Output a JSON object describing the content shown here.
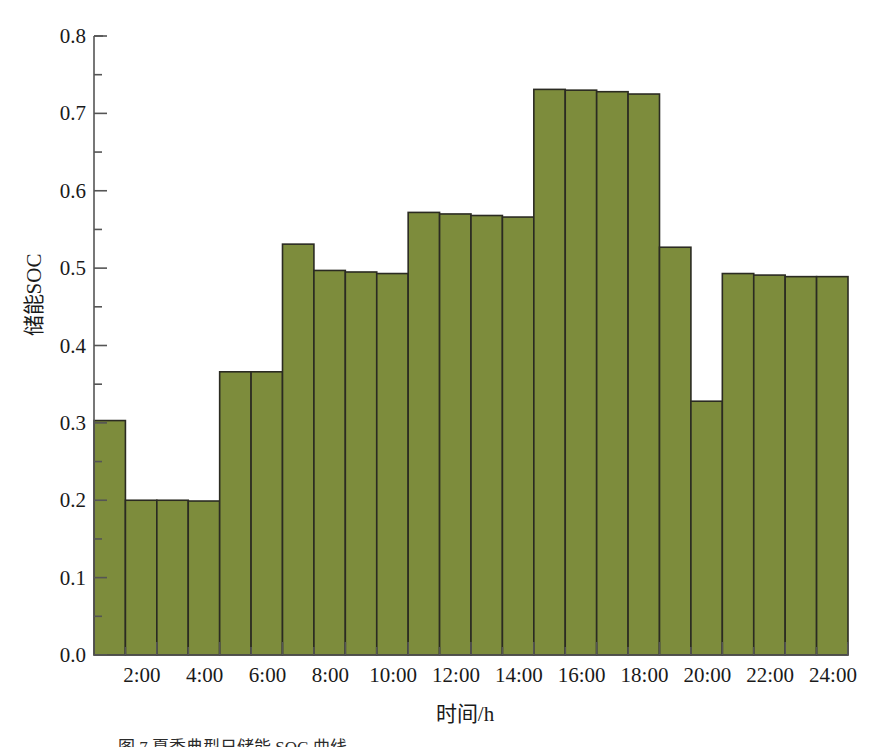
{
  "chart_data": {
    "type": "bar",
    "title": "",
    "xlabel": "时间/h",
    "ylabel": "储能SOC",
    "xlim": [
      0,
      24
    ],
    "ylim": [
      0.0,
      0.8
    ],
    "grid": false,
    "legend": null,
    "bar_color": "#7d8c3c",
    "bar_edge_color": "#2b2b22",
    "axis_color": "#555555",
    "categories": [
      "1:00",
      "2:00",
      "3:00",
      "4:00",
      "5:00",
      "6:00",
      "7:00",
      "8:00",
      "9:00",
      "10:00",
      "11:00",
      "12:00",
      "13:00",
      "14:00",
      "15:00",
      "16:00",
      "17:00",
      "18:00",
      "19:00",
      "20:00",
      "21:00",
      "22:00",
      "23:00",
      "24:00"
    ],
    "values": [
      0.303,
      0.2,
      0.2,
      0.199,
      0.366,
      0.366,
      0.531,
      0.497,
      0.495,
      0.493,
      0.572,
      0.57,
      0.568,
      0.566,
      0.731,
      0.73,
      0.728,
      0.725,
      0.527,
      0.328,
      0.493,
      0.491,
      0.489,
      0.489
    ],
    "y_ticks": [
      "0.0",
      "0.1",
      "0.2",
      "0.3",
      "0.4",
      "0.5",
      "0.6",
      "0.7",
      "0.8"
    ],
    "y_tick_values": [
      0.0,
      0.1,
      0.2,
      0.3,
      0.4,
      0.5,
      0.6,
      0.7,
      0.8
    ],
    "y_minor_tick_values": [
      0.05,
      0.15,
      0.25,
      0.35,
      0.45,
      0.55,
      0.65,
      0.75
    ],
    "x_ticks": [
      "2:00",
      "4:00",
      "6:00",
      "8:00",
      "10:00",
      "12:00",
      "14:00",
      "16:00",
      "18:00",
      "20:00",
      "22:00",
      "24:00"
    ],
    "x_tick_values": [
      2,
      4,
      6,
      8,
      10,
      12,
      14,
      16,
      18,
      20,
      22,
      24
    ],
    "x_minor_tick_values": [
      1,
      3,
      5,
      7,
      9,
      11,
      13,
      15,
      17,
      19,
      21,
      23
    ]
  },
  "caption": {
    "label": "图 7",
    "text": "图 7   夏季典型日储能 SOC 曲线"
  }
}
